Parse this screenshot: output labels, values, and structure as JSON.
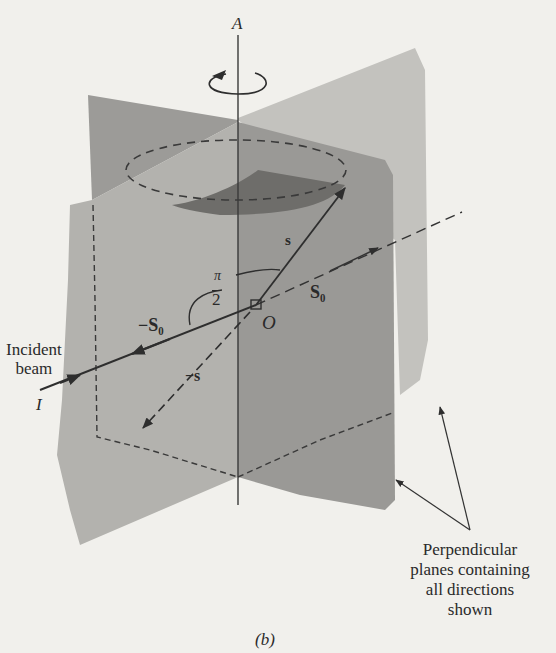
{
  "figure": {
    "panel_label": "(b)",
    "axis_label": "A",
    "origin_label": "O",
    "incident_point_label": "I",
    "vectors": {
      "s": "s",
      "neg_s": "−s",
      "s0": "S₀",
      "neg_s0": "−S₀"
    },
    "angle_label": {
      "numerator": "π",
      "denominator": "2"
    },
    "incident_beam_label": [
      "Incident",
      "beam"
    ],
    "planes_callout": [
      "Perpendicular",
      "planes containing",
      "all directions",
      "shown"
    ]
  },
  "colors": {
    "background": "#f1f0ec",
    "plane_light": "#b9b8b4",
    "plane_mid": "#a4a3a0",
    "plane_dark": "#8f8e8b",
    "disk": "#6f6e6b",
    "line": "#333333"
  }
}
